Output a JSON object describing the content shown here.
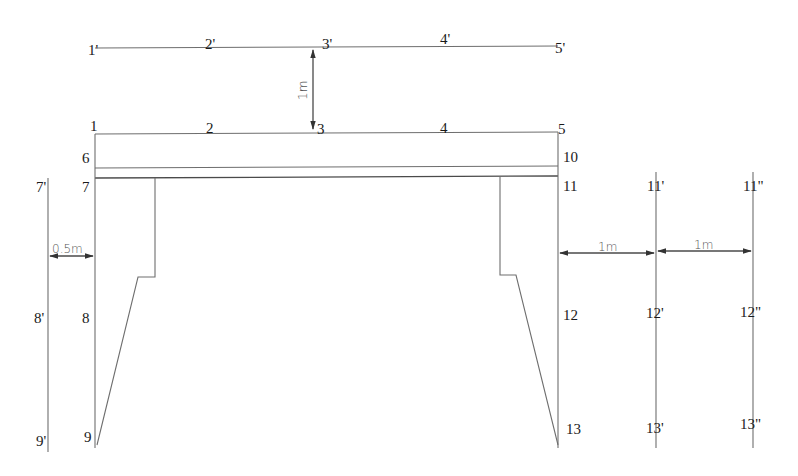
{
  "diagram": {
    "type": "cross-section",
    "colors": {
      "line": "#6e6e6e",
      "text": "#1a1a1a",
      "dimension": "#555555"
    },
    "top_offset_line": {
      "labels": [
        "1'",
        "2'",
        "3'",
        "4'",
        "5'"
      ]
    },
    "deck_top_line": {
      "labels": [
        "1",
        "2",
        "3",
        "4",
        "5"
      ]
    },
    "left_side_labels": {
      "n6": "6",
      "n7": "7",
      "n8": "8",
      "n9": "9"
    },
    "right_side_labels": {
      "n10": "10",
      "n11": "11",
      "n12": "12",
      "n13": "13"
    },
    "left_offset_line": {
      "labels": [
        "7'",
        "8'",
        "9'"
      ]
    },
    "right_offset_line_1": {
      "labels": [
        "11'",
        "12'",
        "13'"
      ]
    },
    "right_offset_line_2": {
      "labels": [
        "11\"",
        "12\"",
        "13\""
      ]
    },
    "dimensions": {
      "vertical_offset": "1m",
      "left_offset": "0.5m",
      "right_offset_1": "1m",
      "right_offset_2": "1m"
    }
  }
}
